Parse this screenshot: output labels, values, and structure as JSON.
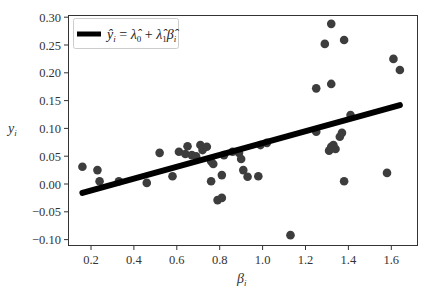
{
  "chart_data": {
    "type": "scatter",
    "title": "",
    "xlabel": "β_i",
    "ylabel": "y_i",
    "xlim": [
      0.1,
      1.72
    ],
    "ylim": [
      -0.112,
      0.305
    ],
    "grid": false,
    "legend_position": "upper left",
    "x_ticks": [
      0.2,
      0.4,
      0.6,
      0.8,
      1.0,
      1.2,
      1.4,
      1.6
    ],
    "x_tick_labels": [
      "0.2",
      "0.4",
      "0.6",
      "0.8",
      "1.0",
      "1.2",
      "1.4",
      "1.6"
    ],
    "y_ticks": [
      -0.1,
      -0.05,
      0.0,
      0.05,
      0.1,
      0.15,
      0.2,
      0.25,
      0.3
    ],
    "y_tick_labels": [
      "−0.10",
      "−0.05",
      "0.00",
      "0.05",
      "0.10",
      "0.15",
      "0.20",
      "0.25",
      "0.30"
    ],
    "series": [
      {
        "name": "observations",
        "type": "scatter",
        "color": "#3d3d3d",
        "points": [
          [
            0.16,
            0.031
          ],
          [
            0.23,
            0.025
          ],
          [
            0.24,
            0.005
          ],
          [
            0.33,
            0.005
          ],
          [
            0.46,
            0.002
          ],
          [
            0.52,
            0.056
          ],
          [
            0.58,
            0.014
          ],
          [
            0.61,
            0.058
          ],
          [
            0.64,
            0.054
          ],
          [
            0.65,
            0.068
          ],
          [
            0.67,
            0.052
          ],
          [
            0.69,
            0.05
          ],
          [
            0.71,
            0.07
          ],
          [
            0.72,
            0.061
          ],
          [
            0.74,
            0.067
          ],
          [
            0.76,
            0.041
          ],
          [
            0.76,
            0.005
          ],
          [
            0.77,
            0.036
          ],
          [
            0.79,
            -0.029
          ],
          [
            0.81,
            -0.025
          ],
          [
            0.81,
            0.016
          ],
          [
            0.82,
            0.052
          ],
          [
            0.86,
            0.058
          ],
          [
            0.89,
            0.056
          ],
          [
            0.9,
            0.045
          ],
          [
            0.91,
            0.025
          ],
          [
            0.93,
            0.013
          ],
          [
            0.98,
            0.014
          ],
          [
            0.99,
            0.07
          ],
          [
            1.02,
            0.074
          ],
          [
            1.13,
            -0.092
          ],
          [
            1.25,
            0.172
          ],
          [
            1.25,
            0.094
          ],
          [
            1.29,
            0.252
          ],
          [
            1.31,
            0.06
          ],
          [
            1.32,
            0.067
          ],
          [
            1.33,
            0.07
          ],
          [
            1.32,
            0.18
          ],
          [
            1.32,
            0.288
          ],
          [
            1.34,
            0.063
          ],
          [
            1.36,
            0.085
          ],
          [
            1.37,
            0.092
          ],
          [
            1.38,
            0.259
          ],
          [
            1.38,
            0.005
          ],
          [
            1.41,
            0.124
          ],
          [
            1.58,
            0.02
          ],
          [
            1.61,
            0.225
          ],
          [
            1.64,
            0.205
          ]
        ]
      },
      {
        "name": "ŷ_i = λ̂_0 + λ̂_1 β̂_i",
        "type": "line",
        "color": "#000000",
        "x": [
          0.16,
          1.64
        ],
        "y": [
          -0.016,
          0.142
        ]
      }
    ],
    "legend": [
      {
        "label": "ŷ_i = λ̂_0 + λ̂_1 β̂_i",
        "marker": "thick-line",
        "color": "#000000"
      }
    ]
  },
  "labels": {
    "xlabel_main": "β",
    "xlabel_sub": "i",
    "ylabel_main": "y",
    "ylabel_sub": "i",
    "legend_y": "ŷ",
    "legend_sub_i": "i",
    "legend_eq": " = ",
    "legend_lambda": "λ̂",
    "legend_sub0": "0",
    "legend_plus": " + ",
    "legend_sub1": "1",
    "legend_beta": "β̂"
  }
}
